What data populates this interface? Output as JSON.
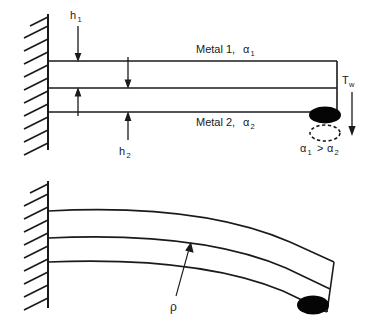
{
  "figure": {
    "panels": [
      {
        "id": "undeflected",
        "caption": "Straight bimetallic cantilever fixed at a wall",
        "labels": {
          "h1": "h",
          "h1_sub": "1",
          "h2": "h",
          "h2_sub": "2",
          "metal1": "Metal 1, ",
          "metal1_alpha": "α",
          "metal1_alpha_sub": "1",
          "metal2": "Metal 2, ",
          "metal2_alpha": "α",
          "metal2_alpha_sub": "2",
          "tw": "T",
          "tw_sub": "w",
          "alpha_compare_a": "α",
          "alpha_compare_a_sub": "1",
          "alpha_compare_op": ">",
          "alpha_compare_b": "α",
          "alpha_compare_b_sub": "2"
        }
      },
      {
        "id": "deflected",
        "caption": "Deflected (curved) bimetallic cantilever",
        "labels": {
          "rho": "ρ"
        }
      }
    ]
  },
  "colors": {
    "ink": "#1a1a1a",
    "blob_fill": "#050505",
    "background": "#ffffff"
  },
  "geometry": {
    "top_panel": {
      "wall_x": 48,
      "wall_top_y": 14,
      "wall_bottom_y": 150,
      "bar_left_x": 48,
      "bar_right_x": 337,
      "bar_top_y": 61,
      "bar_mid_y": 88,
      "bar_bottom_y": 112
    },
    "bottom_panel": {
      "wall_x": 48,
      "wall_top_y": 181,
      "wall_bottom_y": 308,
      "strip_left_x": 48,
      "strip_top_y": 211,
      "strip_mid_y": 238,
      "strip_bottom_y": 262
    }
  }
}
